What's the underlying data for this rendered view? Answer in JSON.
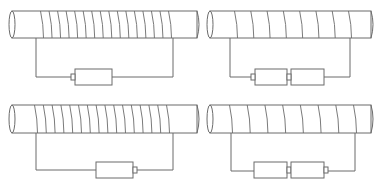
{
  "diagram": {
    "type": "electromagnet-comparison",
    "layout": "2x2 grid",
    "colors": {
      "line": "#6b6b6b",
      "background": "#ffffff"
    },
    "panels": [
      {
        "id": "top-left",
        "coil_turns": 16,
        "battery_count": 1,
        "battery_orientation": "positive-left",
        "tube": {
          "x": 12,
          "y": 11,
          "w": 185,
          "h": 27
        },
        "coil": {
          "x_start": 42,
          "x_end": 170
        },
        "wire": {
          "left_x": 36,
          "right_x": 173,
          "y": 77
        },
        "batteries": [
          {
            "nub_side": "left",
            "x": 75,
            "y": 69,
            "w": 37,
            "h": 16
          }
        ]
      },
      {
        "id": "top-right",
        "coil_turns": 8,
        "battery_count": 2,
        "battery_orientation": "positive-left",
        "tube": {
          "x": 210,
          "y": 11,
          "w": 161,
          "h": 27
        },
        "coil": {
          "x_start": 236,
          "x_end": 350
        },
        "wire": {
          "left_x": 230,
          "right_x": 350,
          "y": 77
        },
        "batteries": [
          {
            "nub_side": "left",
            "x": 255,
            "y": 69,
            "w": 32,
            "h": 16
          },
          {
            "nub_side": "left",
            "x": 291,
            "y": 69,
            "w": 33,
            "h": 16
          }
        ]
      },
      {
        "id": "bottom-left",
        "coil_turns": 16,
        "battery_count": 1,
        "battery_orientation": "positive-right",
        "tube": {
          "x": 12,
          "y": 105,
          "w": 185,
          "h": 28
        },
        "coil": {
          "x_start": 36,
          "x_end": 168
        },
        "wire": {
          "left_x": 36,
          "right_x": 173,
          "y": 170
        },
        "batteries": [
          {
            "nub_side": "right",
            "x": 96,
            "y": 162,
            "w": 37,
            "h": 16
          }
        ]
      },
      {
        "id": "bottom-right",
        "coil_turns": 8,
        "battery_count": 2,
        "battery_orientation": "positive-right",
        "tube": {
          "x": 210,
          "y": 105,
          "w": 161,
          "h": 28
        },
        "coil": {
          "x_start": 231,
          "x_end": 355
        },
        "wire": {
          "left_x": 231,
          "right_x": 355,
          "y": 171
        },
        "batteries": [
          {
            "nub_side": "right",
            "x": 254,
            "y": 162,
            "w": 33,
            "h": 16
          },
          {
            "nub_side": "right",
            "x": 291,
            "y": 162,
            "w": 33,
            "h": 16
          }
        ]
      }
    ]
  }
}
